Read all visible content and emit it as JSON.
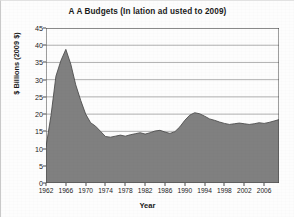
{
  "figure": {
    "background_color": "#fdfdfd",
    "border_color": "#c9c9c9"
  },
  "axis_titles": {
    "y": "$ Billions (2009 $)",
    "x": "Year"
  },
  "chart_data": {
    "type": "area",
    "title": "A  A Budgets (In lation ad usted to 2009)",
    "xlabel": "Year",
    "ylabel": "$ Billions (2009 $)",
    "xlim": [
      1962,
      2009
    ],
    "ylim": [
      0,
      45
    ],
    "grid": true,
    "grid_axis": "y",
    "legend": false,
    "area_fill_color": "#808080",
    "area_line_color": "#4f4f4f",
    "gridline_color": "#8f8f8f",
    "axis_color": "#3f3f3f",
    "ytick_labels": [
      "0",
      "5",
      "10",
      "15",
      "20",
      "25",
      "30",
      "35",
      "40",
      "45"
    ],
    "ytick_values": [
      0,
      5,
      10,
      15,
      20,
      25,
      30,
      35,
      40,
      45
    ],
    "xtick_labels": [
      "1962",
      "1966",
      "1970",
      "1974",
      "1978",
      "1982",
      "1986",
      "1990",
      "1994",
      "1998",
      "2002",
      "2006"
    ],
    "xtick_values": [
      1962,
      1966,
      1970,
      1974,
      1978,
      1982,
      1986,
      1990,
      1994,
      1998,
      2002,
      2006
    ],
    "x": [
      1962,
      1963,
      1964,
      1965,
      1966,
      1967,
      1968,
      1969,
      1970,
      1971,
      1972,
      1973,
      1974,
      1975,
      1976,
      1977,
      1978,
      1979,
      1980,
      1981,
      1982,
      1983,
      1984,
      1985,
      1986,
      1987,
      1988,
      1989,
      1990,
      1991,
      1992,
      1993,
      1994,
      1995,
      1996,
      1997,
      1998,
      1999,
      2000,
      2001,
      2002,
      2003,
      2004,
      2005,
      2006,
      2007,
      2008,
      2009
    ],
    "values": [
      10.5,
      19.5,
      31.0,
      35.5,
      38.8,
      34.5,
      28.5,
      24.0,
      20.0,
      17.5,
      16.5,
      15.0,
      13.5,
      13.3,
      13.6,
      13.9,
      13.6,
      14.0,
      14.3,
      14.6,
      14.2,
      14.6,
      15.1,
      15.3,
      14.8,
      14.4,
      14.9,
      16.3,
      18.2,
      19.7,
      20.4,
      20.1,
      19.4,
      18.6,
      18.2,
      17.7,
      17.3,
      17.0,
      17.2,
      17.4,
      17.2,
      17.0,
      17.2,
      17.5,
      17.3,
      17.6,
      18.0,
      18.4
    ]
  }
}
